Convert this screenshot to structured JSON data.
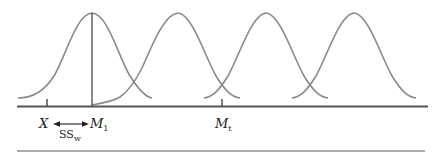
{
  "diagram": {
    "type": "overlapping-normal-distributions",
    "curves": [
      {
        "id": "curve-1",
        "peak_x": 92,
        "label": "M1"
      },
      {
        "id": "curve-2",
        "peak_x": 178
      },
      {
        "id": "curve-3",
        "peak_x": 266
      },
      {
        "id": "curve-4",
        "peak_x": 354
      }
    ],
    "labels": {
      "x_label": "X",
      "m1_main": "M",
      "m1_sub": "1",
      "mt_main": "M",
      "mt_sub": "t",
      "ss_main": "SS",
      "ss_sub": "w"
    },
    "colors": {
      "curve": "#8a8a8a",
      "axis": "#555555",
      "text": "#222222"
    }
  }
}
